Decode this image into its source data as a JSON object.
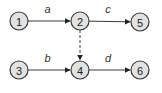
{
  "diagram": {
    "nodes": [
      {
        "id": "1",
        "label": "1"
      },
      {
        "id": "2",
        "label": "2"
      },
      {
        "id": "3",
        "label": "3"
      },
      {
        "id": "4",
        "label": "4"
      },
      {
        "id": "5",
        "label": "5"
      },
      {
        "id": "6",
        "label": "6"
      }
    ],
    "edges": [
      {
        "from": "1",
        "to": "2",
        "label": "a",
        "style": "solid"
      },
      {
        "from": "2",
        "to": "5",
        "label": "c",
        "style": "solid"
      },
      {
        "from": "3",
        "to": "4",
        "label": "b",
        "style": "solid"
      },
      {
        "from": "4",
        "to": "6",
        "label": "d",
        "style": "solid"
      },
      {
        "from": "2",
        "to": "4",
        "label": "",
        "style": "dashed"
      }
    ]
  }
}
